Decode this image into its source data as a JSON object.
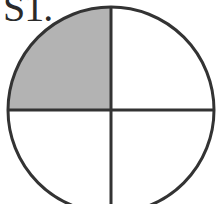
{
  "label": {
    "text": "S1."
  },
  "figure": {
    "shape": "circle",
    "divisions": 4,
    "shaded_quadrants": [
      "top-left"
    ],
    "center": [
      111,
      110
    ],
    "radius": 103,
    "fill_color": "#b3b3b3",
    "stroke_color": "#333333",
    "background_color": "#ffffff"
  }
}
